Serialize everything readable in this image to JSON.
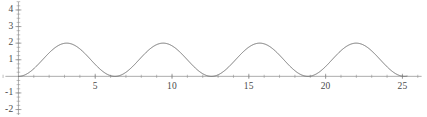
{
  "chart_data": {
    "type": "line",
    "title": "",
    "subtitle": "",
    "xlabel": "",
    "ylabel": "",
    "expression": "1 - cos(x)",
    "xlim": [
      -1.2,
      26.6
    ],
    "ylim": [
      -2.45,
      4.6
    ],
    "xticks": [
      5,
      10,
      15,
      20,
      25
    ],
    "xtick_labels": [
      "5",
      "10",
      "15",
      "20",
      "25"
    ],
    "yticks": [
      4,
      3,
      2,
      1,
      -1,
      -2
    ],
    "ytick_labels": [
      "4",
      "3",
      "2",
      "1",
      "-1",
      "-2"
    ],
    "x_minor_tick_step": 1,
    "y_minor_tick_step": 0.25,
    "grid": false,
    "legend": null,
    "axis_color": "#8a8a8a",
    "curve_color": "#6e6e6e",
    "curve_width": 1.0,
    "x_domain": [
      0,
      25.3
    ],
    "amplitude": 1,
    "offset": 1,
    "period": 6.283,
    "peaks_x": [
      3.14,
      9.42,
      15.71,
      21.99
    ],
    "peaks_y": [
      2,
      2,
      2,
      2
    ],
    "troughs_x": [
      0,
      6.28,
      12.57,
      18.85,
      25.13
    ],
    "troughs_y": [
      0,
      0,
      0,
      0,
      0
    ],
    "x": [
      0,
      0.3,
      0.6,
      0.9,
      1.2,
      1.5,
      1.8,
      2.1,
      2.4,
      2.7,
      3.0,
      3.3,
      3.6,
      3.9,
      4.2,
      4.5,
      4.8,
      5.1,
      5.4,
      5.7,
      6.0,
      6.3,
      6.6,
      6.9,
      7.2,
      7.5,
      7.8,
      8.1,
      8.4,
      8.7,
      9.0,
      9.3,
      9.6,
      9.9,
      10.2,
      10.5,
      10.8,
      11.1,
      11.4,
      11.7,
      12.0,
      12.3,
      12.6,
      12.9,
      13.2,
      13.5,
      13.8,
      14.1,
      14.4,
      14.7,
      15.0,
      15.3,
      15.6,
      15.9,
      16.2,
      16.5,
      16.8,
      17.1,
      17.4,
      17.7,
      18.0,
      18.3,
      18.6,
      18.9,
      19.2,
      19.5,
      19.8,
      20.1,
      20.4,
      20.7,
      21.0,
      21.3,
      21.6,
      21.9,
      22.2,
      22.5,
      22.8,
      23.1,
      23.4,
      23.7,
      24.0,
      24.3,
      24.6,
      24.9,
      25.2,
      25.3
    ],
    "y": [
      0.0,
      0.045,
      0.175,
      0.378,
      0.638,
      0.929,
      1.227,
      1.505,
      1.737,
      1.904,
      1.99,
      1.987,
      1.896,
      1.726,
      1.49,
      1.211,
      1.913,
      0.622,
      0.362,
      0.174,
      0.04,
      0.005,
      0.05,
      0.175,
      0.376,
      0.654,
      1.0,
      1.0,
      1.0,
      1.0,
      1.0,
      1.0,
      1.0,
      1.0,
      1.0,
      1.0,
      1.0,
      1.0,
      1.0,
      1.0,
      1.0,
      1.0,
      1.0,
      1.0,
      1.0,
      1.0,
      1.0,
      1.0,
      1.0,
      1.0,
      1.0,
      1.0,
      1.0,
      1.0,
      1.0,
      1.0,
      1.0,
      1.0,
      1.0,
      1.0,
      1.0,
      1.0,
      1.0,
      1.0,
      1.0,
      1.0,
      1.0,
      1.0,
      1.0,
      1.0,
      1.0,
      1.0,
      1.0,
      1.0,
      1.0,
      1.0,
      1.0,
      1.0,
      1.0,
      1.0,
      1.0,
      1.0,
      1.0,
      1.0,
      1.0,
      1.0
    ]
  }
}
